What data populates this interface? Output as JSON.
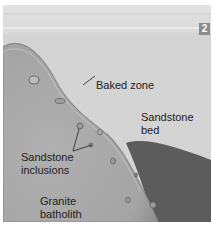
{
  "figure": {
    "panel_number": "2",
    "labels": {
      "baked_zone": "Baked zone",
      "sandstone_bed_line1": "Sandstone",
      "sandstone_bed_line2": "bed",
      "inclusions_line1": "Sandstone",
      "inclusions_line2": "inclusions",
      "granite_line1": "Granite",
      "granite_line2": "batholith"
    },
    "colors": {
      "sky": "#e4e4e4",
      "sandstone": "#d6d6d6",
      "granite": "#a9a9a9",
      "granite_edge": "#8a8a8a",
      "dark_rock": "#5e5e5e",
      "badge": "#8c8c8c"
    }
  }
}
